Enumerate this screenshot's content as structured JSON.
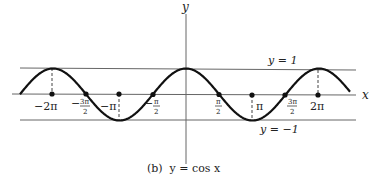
{
  "chart_data": {
    "type": "line",
    "title": "(b) y = cos x",
    "function": "cos(x)",
    "xlabel": "x",
    "ylabel": "y",
    "xlim": [
      -7.0,
      6.4
    ],
    "ylim": [
      -1,
      1
    ],
    "x_ticks": [
      {
        "value": -6.2832,
        "label": "−2π"
      },
      {
        "value": -4.7124,
        "label": "−3π/2"
      },
      {
        "value": -3.1416,
        "label": "−π"
      },
      {
        "value": -1.5708,
        "label": "−π/2"
      },
      {
        "value": 1.5708,
        "label": "π/2"
      },
      {
        "value": 3.1416,
        "label": "π"
      },
      {
        "value": 4.7124,
        "label": "3π/2"
      },
      {
        "value": 6.2832,
        "label": "2π"
      }
    ],
    "reference_lines": [
      {
        "y": 1,
        "label": "y = 1"
      },
      {
        "y": -1,
        "label": "y = −1"
      }
    ],
    "dashed_markers_x": [
      -6.2832,
      -3.1416,
      3.1416,
      6.2832
    ],
    "grid": false,
    "legend": null
  },
  "labels": {
    "y_axis": "y",
    "x_axis": "x",
    "upper_line": "y = 1",
    "lower_line": "y = −1",
    "caption": "(b)  y = cos x",
    "tick_neg_2pi": "−2π",
    "tick_neg_3pi2_sign": "−",
    "tick_neg_3pi2_num": "3π",
    "tick_neg_3pi2_den": "2",
    "tick_neg_pi": "−π",
    "tick_neg_pi2_sign": "−",
    "tick_neg_pi2_num": "π",
    "tick_neg_pi2_den": "2",
    "tick_pi2_num": "π",
    "tick_pi2_den": "2",
    "tick_pi": "π",
    "tick_3pi2_num": "3π",
    "tick_3pi2_den": "2",
    "tick_2pi": "2π"
  },
  "colors": {
    "curve": "#111111",
    "axes": "#555555",
    "text": "#222222"
  }
}
